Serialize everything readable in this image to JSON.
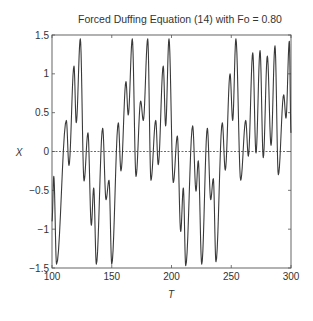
{
  "chart_data": {
    "type": "line",
    "title": "Forced Duffing Equation (14) with Fo = 0.80",
    "xlabel": "T",
    "ylabel": "X",
    "xlim": [
      100,
      300
    ],
    "ylim": [
      -1.5,
      1.5
    ],
    "x_ticks": [
      100,
      150,
      200,
      250,
      300
    ],
    "x_tick_labels": [
      "100",
      "150",
      "200",
      "250",
      "300"
    ],
    "y_ticks": [
      1.5,
      1,
      0.5,
      0,
      -0.5,
      -1,
      -1.5
    ],
    "y_tick_labels": [
      "1.5",
      "1",
      "0.5",
      "0",
      "-0.5",
      "-1",
      "-1.5"
    ],
    "grid": false,
    "reference_line": {
      "y": 0,
      "style": "dashed"
    },
    "line_color": "#3a3a3a",
    "series": [
      {
        "name": "X(T)",
        "description": "extrema of oscillating trajectory (T, X)",
        "points": [
          [
            100,
            -0.9
          ],
          [
            101.5,
            -0.32
          ],
          [
            103.8,
            -1.45
          ],
          [
            112,
            0.4
          ],
          [
            114.2,
            -0.18
          ],
          [
            118.4,
            1.1
          ],
          [
            120.3,
            0.37
          ],
          [
            123.7,
            1.45
          ],
          [
            126.8,
            -0.38
          ],
          [
            130.1,
            0.24
          ],
          [
            132.9,
            -0.95
          ],
          [
            134.9,
            -0.47
          ],
          [
            137.1,
            -1.45
          ],
          [
            142.4,
            0.3
          ],
          [
            145.2,
            -0.62
          ],
          [
            147.7,
            -0.37
          ],
          [
            150,
            -1.45
          ],
          [
            155.5,
            0.37
          ],
          [
            157.7,
            -0.25
          ],
          [
            161.9,
            0.9
          ],
          [
            163.8,
            0.47
          ],
          [
            167.2,
            1.45
          ],
          [
            170.3,
            -0.32
          ],
          [
            174.2,
            0.65
          ],
          [
            176.4,
            0.4
          ],
          [
            180.1,
            1.45
          ],
          [
            182.8,
            -0.37
          ],
          [
            186.8,
            0.4
          ],
          [
            188.9,
            -0.17
          ],
          [
            193.1,
            1.1
          ],
          [
            195.1,
            0.33
          ],
          [
            197.9,
            1.45
          ],
          [
            201.5,
            -0.4
          ],
          [
            204.9,
            0.2
          ],
          [
            207.7,
            -1.03
          ],
          [
            209.9,
            -0.47
          ],
          [
            211.9,
            -1.47
          ],
          [
            217.7,
            0.33
          ],
          [
            220.5,
            -0.51
          ],
          [
            222.4,
            -0.12
          ],
          [
            225.3,
            -1.45
          ],
          [
            230,
            0.3
          ],
          [
            232.8,
            -0.62
          ],
          [
            235,
            -0.35
          ],
          [
            237.2,
            -1.42
          ],
          [
            242.5,
            0.37
          ],
          [
            245,
            -0.24
          ],
          [
            249,
            1.0
          ],
          [
            251.2,
            0.4
          ],
          [
            253.9,
            1.45
          ],
          [
            257.9,
            -0.37
          ],
          [
            262.1,
            0.4
          ],
          [
            264.3,
            -0.06
          ],
          [
            268,
            1.27
          ],
          [
            270.7,
            -0.02
          ],
          [
            274.1,
            1.3
          ],
          [
            276.8,
            -0.08
          ],
          [
            280.2,
            1.23
          ],
          [
            283.3,
            0.08
          ],
          [
            286.6,
            1.36
          ],
          [
            289.4,
            -0.3
          ],
          [
            293.9,
            0.73
          ],
          [
            295.8,
            0.43
          ],
          [
            298.6,
            1.42
          ],
          [
            300,
            0.24
          ]
        ]
      }
    ]
  }
}
